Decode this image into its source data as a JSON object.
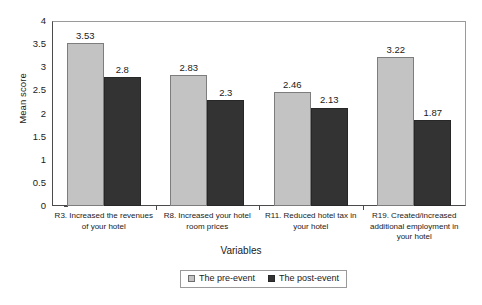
{
  "chart_data": {
    "type": "bar",
    "title": "",
    "xlabel": "Variables",
    "ylabel": "Mean score",
    "ylim": [
      0,
      4
    ],
    "ytick_step": 0.5,
    "yticks": [
      "4",
      "3.5",
      "3",
      "2.5",
      "2",
      "1.5",
      "1",
      "0.5",
      "0"
    ],
    "grid": false,
    "legend_position": "bottom-center",
    "categories": [
      "R3. Increased the revenues of your hotel",
      "R8. Increased your hotel room prices",
      "R11. Reduced hotel tax in your hotel",
      "R19. Created/increased additional employment in your hotel"
    ],
    "category_lines": [
      [
        "R3. Increased the revenues",
        "of your hotel"
      ],
      [
        "R8. Increased your hotel",
        "room prices"
      ],
      [
        "R11. Reduced hotel tax in",
        "your hotel"
      ],
      [
        "R19. Created/increased",
        "additional employment in",
        "your hotel"
      ]
    ],
    "series": [
      {
        "name": "The pre-event",
        "color": "#c3c3c3",
        "values": [
          3.53,
          2.83,
          2.46,
          3.22
        ],
        "labels": [
          "3.53",
          "2.83",
          "2.46",
          "3.22"
        ]
      },
      {
        "name": "The post-event",
        "color": "#333333",
        "values": [
          2.8,
          2.3,
          2.13,
          1.87
        ],
        "labels": [
          "2.8",
          "2.3",
          "2.13",
          "1.87"
        ]
      }
    ]
  },
  "legend": {
    "items": [
      {
        "label": "The pre-event",
        "swatch": "light-gray-square"
      },
      {
        "label": "The post-event",
        "swatch": "dark-square"
      }
    ]
  }
}
